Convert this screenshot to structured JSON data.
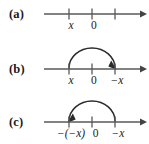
{
  "figure": {
    "caption_parts": [
      "(a)",
      "(b)",
      "(c)"
    ],
    "colors": {
      "background": "#ffffff",
      "line": "#595959",
      "arc": "#2b2b2b",
      "text": "#1a1a1a"
    },
    "axis": {
      "tick_count": 3,
      "tick_positions_pct": [
        26,
        47.5,
        69
      ],
      "arrow_direction": "right"
    },
    "panels": [
      {
        "id": "a",
        "label": "(a)",
        "tick_labels": [
          {
            "text": "x",
            "style": "italic",
            "pos_pct": 26
          },
          {
            "text": "0",
            "style": "upright",
            "pos_pct": 47.5
          }
        ],
        "arc": null
      },
      {
        "id": "b",
        "label": "(b)",
        "tick_labels": [
          {
            "text": "x",
            "style": "italic",
            "pos_pct": 26
          },
          {
            "text": "0",
            "style": "upright",
            "pos_pct": 47.5
          },
          {
            "text": "−x",
            "style": "italic",
            "pos_pct": 69
          }
        ],
        "arc": {
          "from_pct": 26,
          "to_pct": 69,
          "direction": "left-to-right",
          "arrowhead": "right-end"
        }
      },
      {
        "id": "c",
        "label": "(c)",
        "tick_labels": [
          {
            "text": "−(−x)",
            "style": "italic",
            "pos_pct": 26
          },
          {
            "text": "0",
            "style": "upright",
            "pos_pct": 47.5
          },
          {
            "text": "−x",
            "style": "italic",
            "pos_pct": 69
          }
        ],
        "arc": {
          "from_pct": 69,
          "to_pct": 26,
          "direction": "right-to-left",
          "arrowhead": "left-end"
        }
      }
    ]
  }
}
